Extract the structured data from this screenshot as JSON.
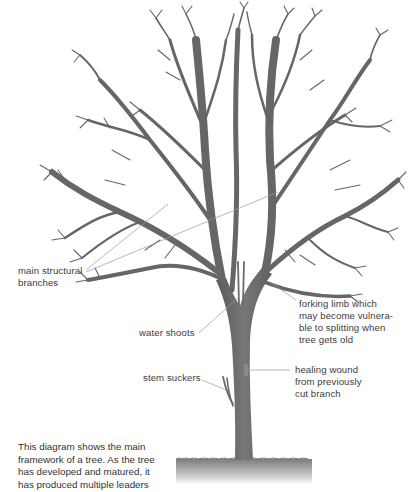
{
  "diagram": {
    "colors": {
      "background": "#ffffff",
      "bark": "#6a6a6a",
      "bark_dark": "#555555",
      "leader_line": "#9a9a9a",
      "text": "#3c3c3c",
      "ground_top": "#7a7a7a",
      "ground_bottom": "#f0f0f0"
    },
    "labels": {
      "main_structural": [
        "main structural",
        "branches"
      ],
      "forking_limb": [
        "forking limb which",
        "may become vulnera-",
        "ble to splitting when",
        "tree gets old"
      ],
      "water_shoots": [
        "water shoots"
      ],
      "stem_suckers": [
        "stem suckers"
      ],
      "healing_wound": [
        "healing wound",
        "from previously",
        "cut branch"
      ]
    },
    "caption": [
      "This diagram shows the main",
      "framework of a tree. As the tree",
      "has developed and matured, it",
      "has produced multiple leaders"
    ]
  }
}
